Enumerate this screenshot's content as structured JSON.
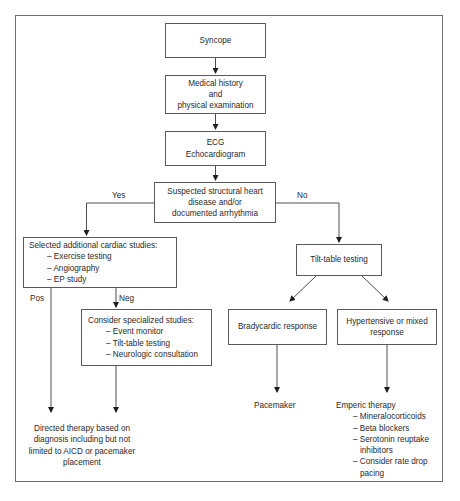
{
  "diagram": {
    "type": "flowchart",
    "topic": "Syncope evaluation algorithm",
    "nodes": {
      "syncope": {
        "lines": [
          "Syncope"
        ]
      },
      "history": {
        "lines": [
          "Medical history",
          "and",
          "physical examination"
        ]
      },
      "ecg": {
        "lines": [
          "ECG",
          "Echocardiogram"
        ]
      },
      "suspected": {
        "lines": [
          "Suspected structural heart",
          "disease and/or",
          "documented arrhythmia"
        ]
      },
      "selected": {
        "title": "Selected additional cardiac studies:",
        "items": [
          "– Exercise testing",
          "– Angiography",
          "– EP study"
        ]
      },
      "consider": {
        "title": "Consider specialized studies:",
        "items": [
          "– Event monitor",
          "– Tilt-table testing",
          "– Neurologic consultation"
        ]
      },
      "tilt": {
        "lines": [
          "Tilt-table testing"
        ]
      },
      "brady": {
        "lines": [
          "Bradycardic response"
        ]
      },
      "hyper": {
        "lines": [
          "Hypertensive or mixed",
          "response"
        ]
      },
      "directed": {
        "lines": [
          "Directed therapy based on",
          "diagnosis including but not",
          "limited to AICD or pacemaker",
          "placement"
        ]
      },
      "pacemaker": {
        "lines": [
          "Pacemaker"
        ]
      },
      "emperic": {
        "title": "Emperic therapy",
        "items": [
          "– Mineralocorticoids",
          "– Beta blockers",
          "– Serotonin reuptake",
          "inhibitors",
          "– Consider rate drop",
          "pacing"
        ]
      }
    },
    "edge_labels": {
      "yes": "Yes",
      "no": "No",
      "pos": "Pos",
      "neg": "Neg"
    },
    "edges": [
      [
        "syncope",
        "history"
      ],
      [
        "history",
        "ecg"
      ],
      [
        "ecg",
        "suspected"
      ],
      [
        "suspected",
        "selected",
        "Yes"
      ],
      [
        "suspected",
        "tilt",
        "No"
      ],
      [
        "selected",
        "directed",
        "Pos"
      ],
      [
        "selected",
        "consider",
        "Neg"
      ],
      [
        "consider",
        "directed"
      ],
      [
        "tilt",
        "brady"
      ],
      [
        "tilt",
        "hyper"
      ],
      [
        "brady",
        "pacemaker"
      ],
      [
        "hyper",
        "emperic"
      ]
    ],
    "colors": {
      "line": "#3a3a3a",
      "box_border": "#5a5a5a",
      "frame": "#6e6e6e",
      "text": "#2a2a2a"
    }
  }
}
